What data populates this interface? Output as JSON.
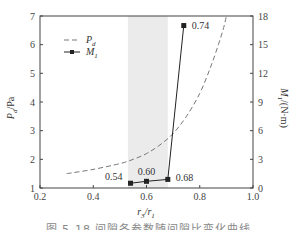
{
  "chart_data": {
    "type": "line",
    "title": "",
    "xlabel": "r3/r1",
    "xlabel_parts": {
      "r3": "r",
      "sub3": "3",
      "slash": "/",
      "r1": "r",
      "sub1": "1"
    },
    "ylabel_left": "Pd/Pa",
    "ylabel_right": "M1/(N·m)",
    "xlim": [
      0.2,
      1.0
    ],
    "ylim_left": [
      1,
      7
    ],
    "ylim_right": [
      0,
      18
    ],
    "x_ticks": [
      "0.2",
      "0.4",
      "0.6",
      "0.8",
      "1.0"
    ],
    "y_left_ticks": [
      "1",
      "2",
      "3",
      "4",
      "5",
      "6",
      "7"
    ],
    "y_right_ticks": [
      "0",
      "3",
      "6",
      "9",
      "12",
      "15",
      "18"
    ],
    "grid": false,
    "legend_position": "upper-left",
    "shaded_region": {
      "x_start": 0.53,
      "x_end": 0.68,
      "color": "#ebebeb"
    },
    "series": [
      {
        "name": "Pd",
        "axis": "left",
        "style": "dashed",
        "color": "#777777",
        "x": [
          0.3,
          0.4,
          0.5,
          0.55,
          0.6,
          0.65,
          0.7,
          0.75,
          0.8,
          0.84,
          0.87,
          0.89,
          0.9
        ],
        "values": [
          1.5,
          1.65,
          1.85,
          2.0,
          2.2,
          2.5,
          2.9,
          3.5,
          4.3,
          5.2,
          6.0,
          6.6,
          7.0
        ]
      },
      {
        "name": "M1",
        "axis": "right",
        "style": "solid-square-markers",
        "color": "#222222",
        "x": [
          0.54,
          0.6,
          0.68,
          0.74
        ],
        "values": [
          0.5,
          0.7,
          0.9,
          17.0
        ],
        "point_labels": [
          "0.54",
          "0.60",
          "0.68",
          "0.74"
        ]
      }
    ]
  },
  "legend": {
    "pd_main": "P",
    "pd_sub": "d",
    "m1_main": "M",
    "m1_sub": "1"
  },
  "axis_labels": {
    "left_main": "P",
    "left_sub": "d",
    "left_unit": "/Pa",
    "right_main": "M",
    "right_sub": "1",
    "right_unit": "/(N·m)",
    "bottom_r3": "r",
    "bottom_sub3": "3",
    "bottom_slash": "/r",
    "bottom_sub1": "1"
  },
  "caption": "图 5-18  间隙各参数随间隙比变化曲线"
}
